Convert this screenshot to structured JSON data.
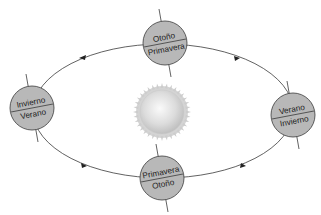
{
  "diagram": {
    "type": "orbit-seasons",
    "orbit_direction": "counter-clockwise",
    "colors": {
      "orbit_line": "#3a3a3a",
      "earth_fill": "#b8b8b8",
      "earth_stroke": "#3a3a3a",
      "sun_core": "#e6e6e6",
      "sun_corona": "#cfcfcf",
      "axis_line": "#3a3a3a"
    },
    "sun": {
      "label": ""
    },
    "earths": [
      {
        "id": "top",
        "north": "Otoño",
        "south": "Primavera"
      },
      {
        "id": "left",
        "north": "Invierno",
        "south": "Verano"
      },
      {
        "id": "right",
        "north": "Verano",
        "south": "Invierno"
      },
      {
        "id": "bottom",
        "north": "Primavera",
        "south": "Otoño"
      }
    ]
  }
}
